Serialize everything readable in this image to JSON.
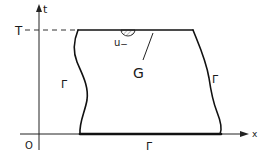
{
  "diagram": {
    "axes": {
      "horizontal_label": "x",
      "vertical_label": "t",
      "origin_label": "O"
    },
    "levels": {
      "top_time_label": "T"
    },
    "region": {
      "label": "G"
    },
    "boundaries": {
      "left_label": "Γ",
      "right_label": "Γ",
      "bottom_label": "Γ"
    },
    "annotations": {
      "half_ball_label": "u",
      "half_ball_subscript": "−"
    },
    "colors": {
      "ink": "#111111",
      "background": "#ffffff"
    }
  }
}
